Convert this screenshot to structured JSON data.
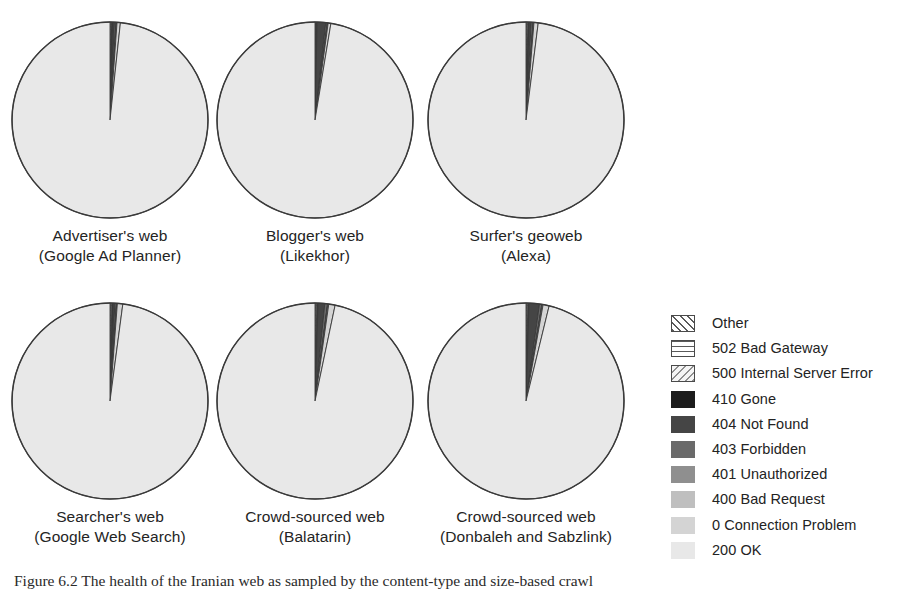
{
  "figure": {
    "caption_label": "Figure 6.2",
    "caption_text": "The health of the Iranian web as sampled by the content-type and size-based crawl"
  },
  "chart_data": {
    "type": "pie",
    "title": "",
    "legend_position": "right",
    "categories": [
      "Other",
      "502 Bad Gateway",
      "500 Internal Server Error",
      "410 Gone",
      "404 Not Found",
      "403 Forbidden",
      "401 Unauthorized",
      "400 Bad Request",
      "0 Connection Problem",
      "200 OK"
    ],
    "category_styles": [
      {
        "name": "Other",
        "swatch": "sw-other",
        "fill": "url(#hatch-fwd)",
        "hex": "#ffffff"
      },
      {
        "name": "502 Bad Gateway",
        "swatch": "sw-horiz",
        "fill": "url(#hatch-horiz)",
        "hex": "#ffffff"
      },
      {
        "name": "500 Internal Server Error",
        "swatch": "sw-backdiag",
        "fill": "url(#hatch-back)",
        "hex": "#f0f0f0"
      },
      {
        "name": "410 Gone",
        "swatch": "sw-solid",
        "fill": "#1c1c1c",
        "hex": "#1c1c1c"
      },
      {
        "name": "404 Not Found",
        "swatch": "sw-solid",
        "fill": "#454545",
        "hex": "#454545"
      },
      {
        "name": "403 Forbidden",
        "swatch": "sw-solid",
        "fill": "#6a6a6a",
        "hex": "#6a6a6a"
      },
      {
        "name": "401 Unauthorized",
        "swatch": "sw-solid",
        "fill": "#8f8f8f",
        "hex": "#8f8f8f"
      },
      {
        "name": "400 Bad Request",
        "swatch": "sw-solid",
        "fill": "#bfbfbf",
        "hex": "#bfbfbf"
      },
      {
        "name": "0 Connection Problem",
        "swatch": "sw-solid",
        "fill": "#d4d4d4",
        "hex": "#d4d4d4"
      },
      {
        "name": "200 OK",
        "swatch": "sw-solid",
        "fill": "#e8e8e8",
        "hex": "#e8e8e8"
      }
    ],
    "panels": [
      {
        "id": "advertisers-web",
        "label_line1": "Advertiser's web",
        "label_line2": "(Google Ad Planner)",
        "values": [
          0.15,
          0.12,
          0.1,
          0.05,
          0.3,
          0.25,
          0.08,
          0.1,
          0.55,
          98.3
        ]
      },
      {
        "id": "bloggers-web",
        "label_line1": "Blogger's web",
        "label_line2": "(Likekhor)",
        "values": [
          0.1,
          0.1,
          0.1,
          0.05,
          1.4,
          0.25,
          0.05,
          0.1,
          0.45,
          97.4
        ]
      },
      {
        "id": "surfers-geoweb",
        "label_line1": "Surfer's geoweb",
        "label_line2": "(Alexa)",
        "values": [
          0.15,
          0.15,
          0.15,
          0.05,
          0.35,
          0.3,
          0.05,
          0.1,
          0.7,
          98.0
        ]
      },
      {
        "id": "searchers-web",
        "label_line1": "Searcher's web",
        "label_line2": "(Google Web Search)",
        "values": [
          0.15,
          0.15,
          0.15,
          0.05,
          0.3,
          0.25,
          0.05,
          0.1,
          0.9,
          97.9
        ]
      },
      {
        "id": "crowd-sourced-balatarin",
        "label_line1": "Crowd-sourced web",
        "label_line2": "(Balatarin)",
        "values": [
          0.15,
          0.15,
          0.15,
          0.05,
          1.1,
          0.45,
          0.05,
          0.15,
          1.05,
          96.7
        ]
      },
      {
        "id": "crowd-sourced-donbaleh",
        "label_line1": "Crowd-sourced web",
        "label_line2": "(Donbaleh and Sabzlink)",
        "values": [
          0.15,
          0.15,
          0.15,
          0.05,
          1.7,
          0.4,
          0.05,
          0.15,
          1.0,
          96.2
        ]
      }
    ],
    "xlabel": "",
    "ylabel": ""
  },
  "layout": {
    "pie_radius": 98,
    "rows": 2,
    "cols": 3
  }
}
